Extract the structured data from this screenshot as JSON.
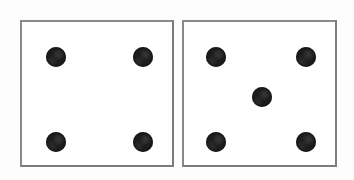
{
  "scene": {
    "title": "Pair of dice",
    "description": "Two six-sided dice shown face-up side by side",
    "background_color": "#fdfdfd",
    "width": 354,
    "height": 180,
    "total_value": "9"
  },
  "style": {
    "die_fill": "#ffffff",
    "die_border_color": "#8a8a8a",
    "die_border_width": "2",
    "pip_color": "#1c1c1c",
    "pip_diameter": "20"
  },
  "dice": [
    {
      "id": "left-die",
      "label": "Left die",
      "value": "4",
      "value_name": "four",
      "x": 20,
      "y": 20,
      "width": 154,
      "height": 147,
      "pips": [
        {
          "name": "pip-top-left",
          "cx": 34,
          "cy": 35,
          "d": 20
        },
        {
          "name": "pip-top-right",
          "cx": 121,
          "cy": 35,
          "d": 20
        },
        {
          "name": "pip-bottom-left",
          "cx": 34,
          "cy": 120,
          "d": 20
        },
        {
          "name": "pip-bottom-right",
          "cx": 121,
          "cy": 120,
          "d": 20
        }
      ]
    },
    {
      "id": "right-die",
      "label": "Right die",
      "value": "5",
      "value_name": "five",
      "x": 182,
      "y": 20,
      "width": 155,
      "height": 147,
      "pips": [
        {
          "name": "pip-top-left",
          "cx": 32,
          "cy": 35,
          "d": 20
        },
        {
          "name": "pip-top-right",
          "cx": 122,
          "cy": 35,
          "d": 20
        },
        {
          "name": "pip-center",
          "cx": 78,
          "cy": 75,
          "d": 20
        },
        {
          "name": "pip-bottom-left",
          "cx": 32,
          "cy": 120,
          "d": 20
        },
        {
          "name": "pip-bottom-right",
          "cx": 122,
          "cy": 120,
          "d": 20
        }
      ]
    }
  ]
}
